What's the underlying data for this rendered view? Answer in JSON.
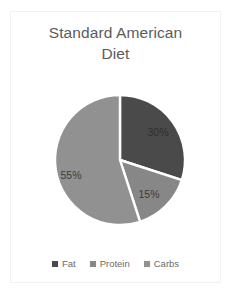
{
  "chart_data": {
    "type": "pie",
    "title": "Standard American Diet",
    "title_line1": "Standard American",
    "title_line2": "Diet",
    "categories": [
      "Fat",
      "Protein",
      "Carbs"
    ],
    "values": [
      30,
      15,
      55
    ],
    "value_labels": [
      "30%",
      "15%",
      "55%"
    ],
    "colors": [
      "#4a4a4a",
      "#878787",
      "#919191"
    ],
    "label_colors": [
      "#2e2e2e",
      "#3c3c3c",
      "#3c3c3c"
    ],
    "legend_position": "bottom",
    "grid": false,
    "start_angle_deg": 0,
    "direction": "clockwise",
    "separator_color": "#ffffff",
    "xlabel": "",
    "ylabel": ""
  },
  "frame": {
    "border_color": "#f1f1f1",
    "background": "#ffffff"
  },
  "title": {
    "text": "Standard American Diet",
    "color": "#5b5b5b"
  },
  "legend": {
    "items": [
      {
        "label": "Fat",
        "color": "#4a4a4a"
      },
      {
        "label": "Protein",
        "color": "#878787"
      },
      {
        "label": "Carbs",
        "color": "#919191"
      }
    ]
  },
  "labels": [
    {
      "text": "30%",
      "x": 158,
      "y": 132,
      "color": "#2e2e2e"
    },
    {
      "text": "15%",
      "x": 149,
      "y": 194,
      "color": "#3c3c3c"
    },
    {
      "text": "55%",
      "x": 71,
      "y": 175,
      "color": "#3c3c3c"
    }
  ]
}
